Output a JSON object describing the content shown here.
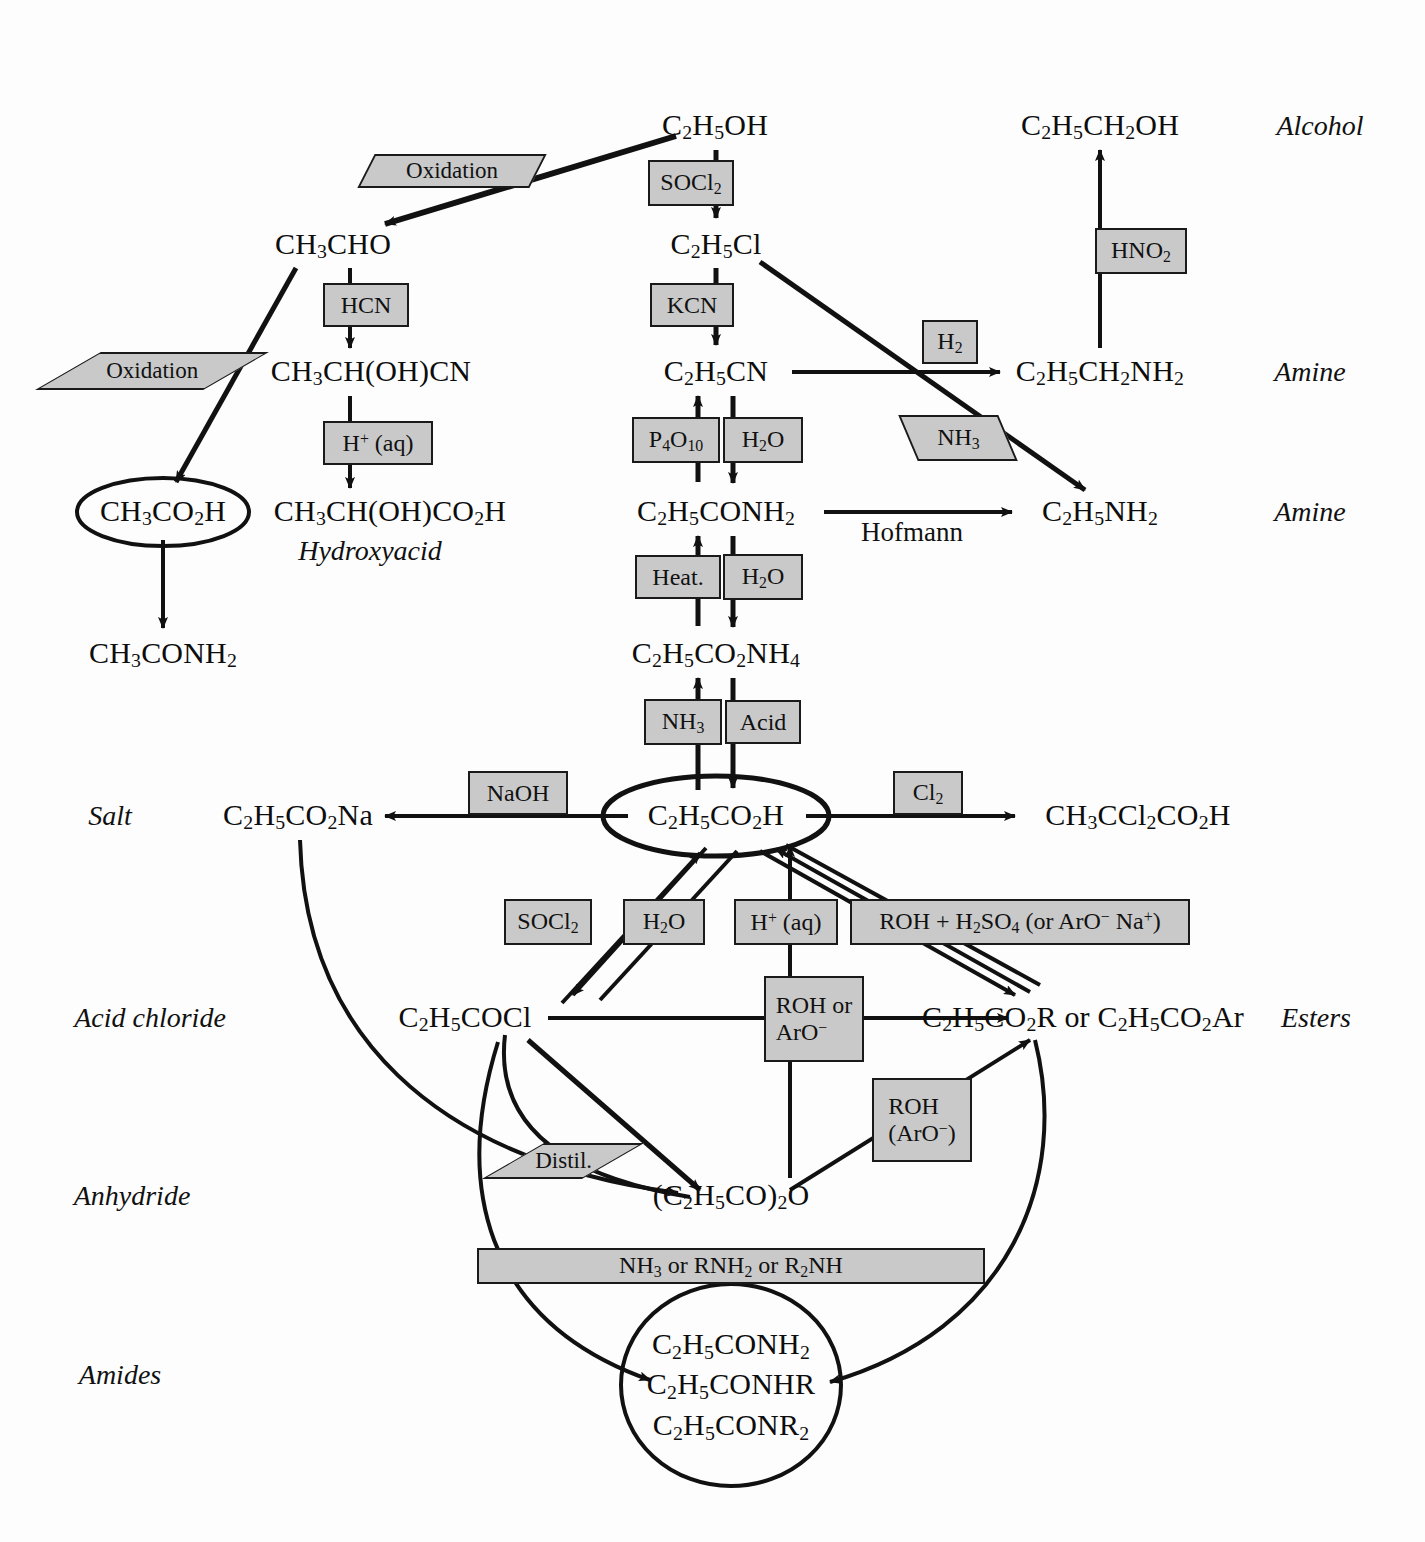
{
  "diagram": {
    "type": "reaction-flowchart",
    "colors": {
      "reagent_box_fill": "#c9c9c9",
      "reagent_box_border": "#1a1a1a",
      "ink": "#111111",
      "background": "#fdfdfd"
    }
  },
  "nodes": [
    {
      "id": "ethanol",
      "label": "C₂H₅OH",
      "html": "C<sub>2</sub>H<sub>5</sub>OH",
      "x": 715,
      "y": 126,
      "ring": "none"
    },
    {
      "id": "propanol",
      "label": "C₂H₅CH₂OH",
      "html": "C<sub>2</sub>H<sub>5</sub>CH<sub>2</sub>OH",
      "x": 1100,
      "y": 126,
      "ring": "none"
    },
    {
      "id": "acetaldehyde",
      "label": "CH₃CHO",
      "html": "CH<sub>3</sub>CHO",
      "x": 333,
      "y": 245,
      "ring": "none"
    },
    {
      "id": "chloroethane",
      "label": "C₂H₅Cl",
      "html": "C<sub>2</sub>H<sub>5</sub>Cl",
      "x": 716,
      "y": 245,
      "ring": "none"
    },
    {
      "id": "cyanohydrin",
      "label": "CH₃CH(OH)CN",
      "html": "CH<sub>3</sub>CH(OH)CN",
      "x": 371,
      "y": 372,
      "ring": "none"
    },
    {
      "id": "propanenitrile",
      "label": "C₂H₅CN",
      "html": "C<sub>2</sub>H<sub>5</sub>CN",
      "x": 716,
      "y": 372,
      "ring": "none"
    },
    {
      "id": "propylamine",
      "label": "C₂H₅CH₂NH₂",
      "html": "C<sub>2</sub>H<sub>5</sub>CH<sub>2</sub>NH<sub>2</sub>",
      "x": 1100,
      "y": 372,
      "ring": "none"
    },
    {
      "id": "aceticacid",
      "label": "CH₃CO₂H",
      "html": "CH<sub>3</sub>CO<sub>2</sub>H",
      "x": 163,
      "y": 512,
      "ring": "ellipse"
    },
    {
      "id": "lacticacid",
      "label": "CH₃CH(OH)CO₂H",
      "html": "CH<sub>3</sub>CH(OH)CO<sub>2</sub>H",
      "x": 390,
      "y": 512,
      "ring": "none"
    },
    {
      "id": "propanamide",
      "label": "C₂H₅CONH₂",
      "html": "C<sub>2</sub>H<sub>5</sub>CONH<sub>2</sub>",
      "x": 716,
      "y": 512,
      "ring": "none"
    },
    {
      "id": "ethylamine",
      "label": "C₂H₅NH₂",
      "html": "C<sub>2</sub>H<sub>5</sub>NH<sub>2</sub>",
      "x": 1100,
      "y": 512,
      "ring": "none"
    },
    {
      "id": "acetamide",
      "label": "CH₃CONH₂",
      "html": "CH<sub>3</sub>CONH<sub>2</sub>",
      "x": 163,
      "y": 654,
      "ring": "none"
    },
    {
      "id": "ammoniumsalt",
      "label": "C₂H₅CO₂NH₄",
      "html": "C<sub>2</sub>H<sub>5</sub>CO<sub>2</sub>NH<sub>4</sub>",
      "x": 716,
      "y": 654,
      "ring": "none"
    },
    {
      "id": "propanoicacid",
      "label": "C₂H₅CO₂H",
      "html": "C<sub>2</sub>H<sub>5</sub>CO<sub>2</sub>H",
      "x": 716,
      "y": 816,
      "ring": "ellipse"
    },
    {
      "id": "sodiumsalt",
      "label": "C₂H₅CO₂Na",
      "html": "C<sub>2</sub>H<sub>5</sub>CO<sub>2</sub>Na",
      "x": 298,
      "y": 816,
      "ring": "none"
    },
    {
      "id": "dichloroacid",
      "label": "CH₃CCl₂CO₂H",
      "html": "CH<sub>3</sub>CCl<sub>2</sub>CO<sub>2</sub>H",
      "x": 1138,
      "y": 816,
      "ring": "none"
    },
    {
      "id": "acidchloride",
      "label": "C₂H₅COCl",
      "html": "C<sub>2</sub>H<sub>5</sub>COCl",
      "x": 465,
      "y": 1018,
      "ring": "none"
    },
    {
      "id": "esters",
      "label": "C₂H₅CO₂R or C₂H₅CO₂Ar",
      "html": "C<sub>2</sub>H<sub>5</sub>CO<sub>2</sub>R or C<sub>2</sub>H<sub>5</sub>CO<sub>2</sub>Ar",
      "x": 1083,
      "y": 1018,
      "ring": "none"
    },
    {
      "id": "anhydride",
      "label": "(C₂H₅CO)₂O",
      "html": "(C<sub>2</sub>H<sub>5</sub>CO)<sub>2</sub>O",
      "x": 731,
      "y": 1196,
      "ring": "none"
    },
    {
      "id": "amides",
      "label": "C₂H₅CONH₂ / C₂H₅CONHR / C₂H₅CONR₂",
      "html": "C<sub>2</sub>H<sub>5</sub>CONH<sub>2</sub><br>C<sub>2</sub>H<sub>5</sub>CONHR<br>C<sub>2</sub>H<sub>5</sub>CONR<sub>2</sub>",
      "x": 731,
      "y": 1385,
      "ring": "circle"
    }
  ],
  "reagent_boxes": [
    {
      "id": "ox-top",
      "label": "Oxidation",
      "html": "Oxidation",
      "x": 452,
      "y": 171,
      "w": 172,
      "h": 34,
      "skew": "skewL"
    },
    {
      "id": "socl2-top",
      "label": "SOCl₂",
      "html": "SOCl<sub>2</sub>",
      "x": 691,
      "y": 183,
      "w": 86,
      "h": 44,
      "skew": "none"
    },
    {
      "id": "hno2",
      "label": "HNO₂",
      "html": "HNO<sub>2</sub>",
      "x": 1141,
      "y": 251,
      "w": 90,
      "h": 44,
      "skew": "none"
    },
    {
      "id": "hcn",
      "label": "HCN",
      "html": "HCN",
      "x": 366,
      "y": 305,
      "w": 84,
      "h": 42,
      "skew": "none"
    },
    {
      "id": "kcn",
      "label": "KCN",
      "html": "KCN",
      "x": 692,
      "y": 305,
      "w": 82,
      "h": 42,
      "skew": "none"
    },
    {
      "id": "ox-left",
      "label": "Oxidation",
      "html": "Oxidation",
      "x": 152,
      "y": 371,
      "w": 166,
      "h": 36,
      "skew": "skewS"
    },
    {
      "id": "h2",
      "label": "H₂",
      "html": "H<sub>2</sub>",
      "x": 950,
      "y": 342,
      "w": 52,
      "h": 42,
      "skew": "none"
    },
    {
      "id": "hplus-aq-1",
      "label": "H⁺ (aq)",
      "html": "H<sup>+</sup> (aq)",
      "x": 378,
      "y": 443,
      "w": 104,
      "h": 42,
      "skew": "none"
    },
    {
      "id": "p4o10",
      "label": "P₄O₁₀",
      "html": "P<sub>4</sub>O<sub>10</sub>",
      "x": 676,
      "y": 440,
      "w": 84,
      "h": 44,
      "skew": "none"
    },
    {
      "id": "h2o-1",
      "label": "H₂O",
      "html": "H<sub>2</sub>O",
      "x": 763,
      "y": 440,
      "w": 78,
      "h": 44,
      "skew": "none"
    },
    {
      "id": "nh3-hof",
      "label": "NH₃",
      "html": "NH<sub>3</sub>",
      "x": 958,
      "y": 438,
      "w": 96,
      "h": 44,
      "skew": "skewR"
    },
    {
      "id": "heat",
      "label": "Heat.",
      "html": "Heat.",
      "x": 678,
      "y": 577,
      "w": 82,
      "h": 42,
      "skew": "none"
    },
    {
      "id": "h2o-2",
      "label": "H₂O",
      "html": "H<sub>2</sub>O",
      "x": 763,
      "y": 577,
      "w": 78,
      "h": 44,
      "skew": "none"
    },
    {
      "id": "nh3-salt",
      "label": "NH₃",
      "html": "NH<sub>3</sub>",
      "x": 683,
      "y": 722,
      "w": 74,
      "h": 44,
      "skew": "none"
    },
    {
      "id": "acid",
      "label": "Acid",
      "html": "Acid",
      "x": 763,
      "y": 722,
      "w": 72,
      "h": 42,
      "skew": "none"
    },
    {
      "id": "naoh",
      "label": "NaOH",
      "html": "NaOH",
      "x": 518,
      "y": 793,
      "w": 98,
      "h": 42,
      "skew": "none"
    },
    {
      "id": "cl2",
      "label": "Cl₂",
      "html": "Cl<sub>2</sub>",
      "x": 928,
      "y": 793,
      "w": 66,
      "h": 42,
      "skew": "none"
    },
    {
      "id": "socl2-bot",
      "label": "SOCl₂",
      "html": "SOCl<sub>2</sub>",
      "x": 548,
      "y": 922,
      "w": 86,
      "h": 44,
      "skew": "none"
    },
    {
      "id": "h2o-3",
      "label": "H₂O",
      "html": "H<sub>2</sub>O",
      "x": 664,
      "y": 922,
      "w": 78,
      "h": 44,
      "skew": "none"
    },
    {
      "id": "hplus-aq-2",
      "label": "H⁺ (aq)",
      "html": "H<sup>+</sup> (aq)",
      "x": 786,
      "y": 922,
      "w": 100,
      "h": 44,
      "skew": "none"
    },
    {
      "id": "roh-h2so4",
      "label": "ROH + H₂SO₄ (or ArO⁻ Na⁺)",
      "html": "ROH + H<sub>2</sub>SO<sub>4</sub> (or ArO<sup>−</sup> Na<sup>+</sup>)",
      "x": 1020,
      "y": 922,
      "w": 336,
      "h": 44,
      "skew": "none"
    },
    {
      "id": "roh-aro",
      "label": "ROH or ArO⁻",
      "html": "ROH or<br>ArO<sup>−</sup>",
      "x": 814,
      "y": 1019,
      "w": 96,
      "h": 82,
      "skew": "two"
    },
    {
      "id": "roh-aro2",
      "label": "ROH (ArO⁻)",
      "html": "ROH<br>(ArO<sup>−</sup>)",
      "x": 922,
      "y": 1120,
      "w": 96,
      "h": 80,
      "skew": "two"
    },
    {
      "id": "distil",
      "label": "Distil.",
      "html": "Distil.",
      "x": 563,
      "y": 1161,
      "w": 96,
      "h": 34,
      "skew": "skewS"
    },
    {
      "id": "nh3-rnh2",
      "label": "NH₃ or RNH₂ or R₂NH",
      "html": "NH<sub>3</sub> or RNH<sub>2</sub> or R<sub>2</sub>NH",
      "x": 731,
      "y": 1266,
      "w": 504,
      "h": 34,
      "skew": "none"
    }
  ],
  "plain_labels": [
    {
      "id": "hofmann",
      "text": "Hofmann",
      "x": 912,
      "y": 532
    }
  ],
  "category_labels": [
    {
      "id": "alcohol",
      "text": "Alcohol",
      "x": 1320,
      "y": 126,
      "side": "right"
    },
    {
      "id": "amine-1",
      "text": "Amine",
      "x": 1310,
      "y": 372,
      "side": "right"
    },
    {
      "id": "amine-2",
      "text": "Amine",
      "x": 1310,
      "y": 512,
      "side": "right"
    },
    {
      "id": "hydroxyacid",
      "text": "Hydroxyacid",
      "x": 370,
      "y": 551,
      "side": "under"
    },
    {
      "id": "salt",
      "text": "Salt",
      "x": 110,
      "y": 816,
      "side": "left"
    },
    {
      "id": "acid-chloride",
      "text": "Acid chloride",
      "x": 150,
      "y": 1018,
      "side": "left"
    },
    {
      "id": "anhydride-lbl",
      "text": "Anhydride",
      "x": 132,
      "y": 1196,
      "side": "left"
    },
    {
      "id": "amides-lbl",
      "text": "Amides",
      "x": 120,
      "y": 1375,
      "side": "left"
    },
    {
      "id": "esters-lbl",
      "text": "Esters",
      "x": 1316,
      "y": 1018,
      "side": "right"
    }
  ],
  "reactions": [
    {
      "from": "ethanol",
      "to": "acetaldehyde",
      "reagent": "Oxidation"
    },
    {
      "from": "ethanol",
      "to": "chloroethane",
      "reagent": "SOCl₂"
    },
    {
      "from": "acetaldehyde",
      "to": "cyanohydrin",
      "reagent": "HCN"
    },
    {
      "from": "acetaldehyde",
      "to": "aceticacid",
      "reagent": "Oxidation"
    },
    {
      "from": "cyanohydrin",
      "to": "lacticacid",
      "reagent": "H⁺ (aq)"
    },
    {
      "from": "aceticacid",
      "to": "acetamide",
      "reagent": ""
    },
    {
      "from": "chloroethane",
      "to": "propanenitrile",
      "reagent": "KCN"
    },
    {
      "from": "chloroethane",
      "to": "ethylamine",
      "reagent": "NH₃"
    },
    {
      "from": "propanenitrile",
      "to": "propylamine",
      "reagent": "H₂"
    },
    {
      "from": "propylamine",
      "to": "propanol",
      "reagent": "HNO₂"
    },
    {
      "from": "propanenitrile",
      "to": "propanamide",
      "reagent": "H₂O"
    },
    {
      "from": "propanamide",
      "to": "propanenitrile",
      "reagent": "P₄O₁₀"
    },
    {
      "from": "propanamide",
      "to": "ethylamine",
      "reagent": "Hofmann"
    },
    {
      "from": "propanamide",
      "to": "ammoniumsalt",
      "reagent": "H₂O"
    },
    {
      "from": "ammoniumsalt",
      "to": "propanamide",
      "reagent": "Heat."
    },
    {
      "from": "ammoniumsalt",
      "to": "propanoicacid",
      "reagent": "Acid"
    },
    {
      "from": "propanoicacid",
      "to": "ammoniumsalt",
      "reagent": "NH₃"
    },
    {
      "from": "propanoicacid",
      "to": "sodiumsalt",
      "reagent": "NaOH"
    },
    {
      "from": "propanoicacid",
      "to": "dichloroacid",
      "reagent": "Cl₂"
    },
    {
      "from": "propanoicacid",
      "to": "acidchloride",
      "reagent": "SOCl₂"
    },
    {
      "from": "acidchloride",
      "to": "propanoicacid",
      "reagent": "H₂O"
    },
    {
      "from": "propanoicacid",
      "to": "esters",
      "reagent": "ROH + H₂SO₄ (or ArO⁻ Na⁺)"
    },
    {
      "from": "esters",
      "to": "propanoicacid",
      "reagent": "H⁺ (aq)"
    },
    {
      "from": "propanoicacid",
      "to": "anhydride",
      "reagent": ""
    },
    {
      "from": "acidchloride",
      "to": "esters",
      "reagent": "ROH or ArO⁻"
    },
    {
      "from": "acidchloride",
      "to": "anhydride",
      "reagent": "Distil."
    },
    {
      "from": "sodiumsalt",
      "to": "anhydride",
      "reagent": ""
    },
    {
      "from": "anhydride",
      "to": "esters",
      "reagent": "ROH (ArO⁻)"
    },
    {
      "from": "acidchloride",
      "to": "amides",
      "reagent": "NH₃ or RNH₂ or R₂NH"
    },
    {
      "from": "esters",
      "to": "amides",
      "reagent": "NH₃ or RNH₂ or R₂NH"
    }
  ]
}
